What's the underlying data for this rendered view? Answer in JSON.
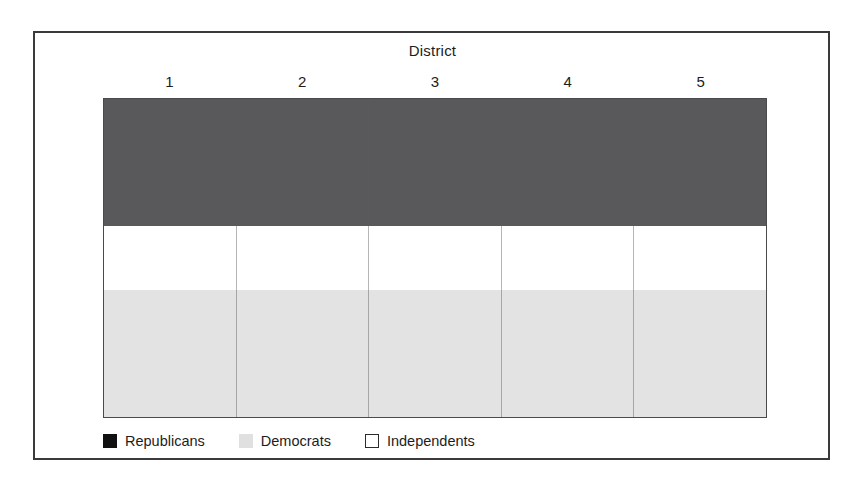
{
  "figure": {
    "title": "District",
    "background_color": "#ffffff",
    "frame_color": "#3a3a3c"
  },
  "legend": {
    "position": "bottom-left",
    "items": [
      {
        "label": "Republicans",
        "swatch": "republicans-swatch",
        "color": "#111111"
      },
      {
        "label": "Democrats",
        "swatch": "democrats-swatch",
        "color": "#e0e0e0"
      },
      {
        "label": "Independents",
        "swatch": "independents-swatch",
        "color": "#ffffff"
      }
    ]
  },
  "chart_data": {
    "type": "bar",
    "orientation": "vertical-stacked",
    "title": "District",
    "xlabel": "District",
    "ylabel": "",
    "categories": [
      "1",
      "2",
      "3",
      "4",
      "5"
    ],
    "stack_order_top_to_bottom": [
      "Republicans",
      "Independents",
      "Democrats"
    ],
    "ylim": [
      0,
      100
    ],
    "grid": false,
    "y_axis_ticks_shown": false,
    "legend_position": "bottom-left",
    "series": [
      {
        "name": "Republicans",
        "color": "#59595b",
        "values": [
          40,
          40,
          40,
          40,
          40
        ]
      },
      {
        "name": "Independents",
        "color": "#ffffff",
        "values": [
          20,
          20,
          20,
          20,
          20
        ]
      },
      {
        "name": "Democrats",
        "color": "#e3e3e3",
        "values": [
          40,
          40,
          40,
          40,
          40
        ]
      }
    ]
  }
}
